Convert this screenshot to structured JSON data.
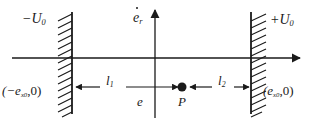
{
  "figure": {
    "width": 314,
    "height": 124,
    "background_color": "#ffffff",
    "stroke_color": "#1a1a1a"
  },
  "labels": {
    "left_plate_potential": "−U",
    "left_plate_potential_sub": "0",
    "right_plate_potential": "+U",
    "right_plate_potential_sub": "0",
    "vertical_axis": "e",
    "vertical_axis_sub": "r",
    "horizontal_axis": "e",
    "left_coordinate_open": "(−e",
    "left_coordinate_sub": "x0",
    "left_coordinate_close": ",0)",
    "right_coordinate_open": "(e",
    "right_coordinate_sub": "x0",
    "right_coordinate_close": ",0)",
    "distance_left": "l",
    "distance_left_sub": "1",
    "distance_right": "l",
    "distance_right_sub": "2",
    "point_label": "P"
  },
  "geometry": {
    "horizontal_axis_y": 58,
    "horizontal_axis_x_start": 12,
    "horizontal_axis_x_end": 302,
    "vertical_axis_x": 155,
    "vertical_axis_y_top": 8,
    "vertical_axis_y_bottom": 118,
    "left_wall_x": 72,
    "right_wall_x": 251,
    "wall_y_top": 12,
    "wall_y_bottom": 114,
    "hatch_length": 15,
    "dimension_line_y": 87,
    "point_p_x": 182,
    "point_p_y": 87,
    "point_p_radius": 4.5
  }
}
